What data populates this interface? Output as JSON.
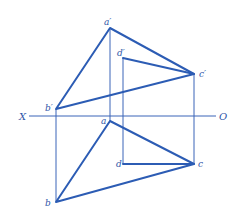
{
  "diagram": {
    "type": "orthographic-projection",
    "colors": {
      "line": "#2c5cb4",
      "thin_line": "#3a64b8",
      "label": "#2f56a8",
      "background": "#ffffff"
    },
    "axis": {
      "left_label": "X",
      "right_label": "O",
      "y": 116,
      "x1": 29,
      "x2": 216
    },
    "points": {
      "a_prime": {
        "label": "a′",
        "x": 110,
        "y": 28
      },
      "b_prime": {
        "label": "b′",
        "x": 56,
        "y": 109
      },
      "c_prime": {
        "label": "c′",
        "x": 194,
        "y": 74
      },
      "d_prime": {
        "label": "d′",
        "x": 123,
        "y": 58
      },
      "a": {
        "label": "a",
        "x": 110,
        "y": 121
      },
      "b": {
        "label": "b",
        "x": 56,
        "y": 202
      },
      "c": {
        "label": "c",
        "x": 194,
        "y": 164
      },
      "d": {
        "label": "d",
        "x": 123,
        "y": 164
      }
    },
    "front_view_triangle": [
      "a′",
      "b′",
      "c′"
    ],
    "top_view_triangle": [
      "a",
      "b",
      "c"
    ],
    "line_d_prime_c_prime": [
      "d′",
      "c′"
    ],
    "line_d_c": [
      "d",
      "c"
    ],
    "projection_lines": [
      [
        "b′",
        "b"
      ],
      [
        "a′",
        "a"
      ],
      [
        "d′",
        "d"
      ],
      [
        "c′",
        "c"
      ]
    ]
  }
}
